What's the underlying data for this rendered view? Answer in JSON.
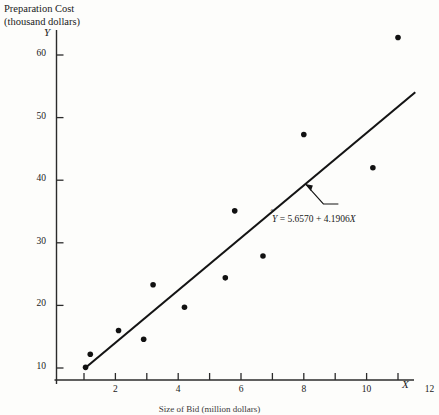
{
  "chart_data": {
    "type": "scatter",
    "title": "Preparation Cost (thousand dollars)",
    "title_line1": "Preparation Cost",
    "title_line2": "(thousand dollars)",
    "xlabel": "Size of Bid (million dollars)",
    "ylabel": "Preparation Cost (thousand dollars)",
    "x_var": "X",
    "y_var": "Y",
    "xlim": [
      0,
      12.6
    ],
    "ylim": [
      8.2,
      65
    ],
    "grid": false,
    "legend": null,
    "x_ticks": [
      1,
      2,
      3,
      4,
      5,
      6,
      7,
      8,
      9,
      10,
      11,
      12
    ],
    "x_tick_labels": [
      "",
      "2",
      "",
      "4",
      "",
      "6",
      "",
      "8",
      "",
      "10",
      "",
      "12"
    ],
    "y_ticks": [
      10,
      20,
      30,
      40,
      50,
      60
    ],
    "y_tick_labels": [
      "10",
      "20",
      "30",
      "40",
      "50",
      "60"
    ],
    "points": [
      {
        "x": 1.05,
        "y": 10.1
      },
      {
        "x": 1.2,
        "y": 12.2
      },
      {
        "x": 2.1,
        "y": 16.0
      },
      {
        "x": 2.9,
        "y": 14.6
      },
      {
        "x": 3.2,
        "y": 23.3
      },
      {
        "x": 4.2,
        "y": 19.7
      },
      {
        "x": 5.5,
        "y": 24.4
      },
      {
        "x": 5.8,
        "y": 35.1
      },
      {
        "x": 6.7,
        "y": 27.9
      },
      {
        "x": 8.0,
        "y": 47.3
      },
      {
        "x": 10.2,
        "y": 42.0
      },
      {
        "x": 11.0,
        "y": 62.8
      }
    ],
    "regression": {
      "equation_text": "= 5.6570 + 4.1906",
      "y_hat_symbol": "Y",
      "x_symbol": "X",
      "intercept": 5.657,
      "slope": 4.1906,
      "x_start": 1.0,
      "x_end": 11.55
    },
    "annotation": {
      "label": "regression equation callout",
      "anchor_x": 8.05,
      "anchor_y": 39.4
    },
    "colors": {
      "axis": "#2b2b2b",
      "point": "#111111",
      "line": "#141414",
      "text": "#1a1a1a"
    }
  }
}
